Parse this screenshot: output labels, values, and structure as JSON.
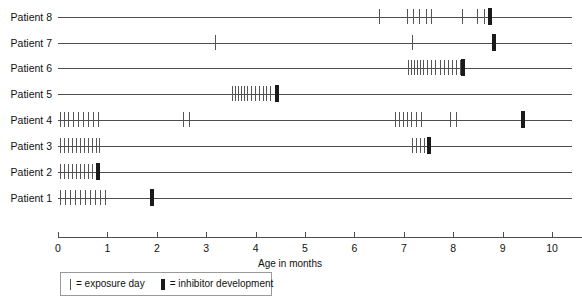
{
  "chart_data": {
    "type": "timeline",
    "title": "",
    "xlabel": "Age in months",
    "ylabel": "",
    "xlim": [
      0,
      10.6
    ],
    "xticks": [
      0,
      1,
      2,
      3,
      4,
      5,
      6,
      7,
      8,
      9,
      10
    ],
    "xtick_labels": [
      "0",
      "1",
      "2",
      "3",
      "4",
      "5",
      "6",
      "7",
      "8",
      "9",
      "10"
    ],
    "grid": false,
    "legend_position": "bottom-left",
    "colors": {
      "exposure": "#555555",
      "inhibitor": "#1a1a1a",
      "axis": "#4d4d4d"
    },
    "series": [
      {
        "name": "Patient 8",
        "line_start": 0.0,
        "line_end": 10.4,
        "exposure_days": [
          6.5,
          7.06,
          7.18,
          7.3,
          7.44,
          7.56,
          8.18,
          8.48,
          8.62
        ],
        "inhibitor_development": 8.74
      },
      {
        "name": "Patient 7",
        "line_start": 0.0,
        "line_end": 10.4,
        "exposure_days": [
          3.18,
          7.16
        ],
        "inhibitor_development": 8.82
      },
      {
        "name": "Patient 6",
        "line_start": 0.0,
        "line_end": 10.4,
        "exposure_days": [
          7.08,
          7.14,
          7.2,
          7.26,
          7.32,
          7.38,
          7.46,
          7.56,
          7.64,
          7.74,
          7.82,
          7.9,
          7.98,
          8.06,
          8.14
        ],
        "inhibitor_development": 8.2
      },
      {
        "name": "Patient 5",
        "line_start": 0.0,
        "line_end": 10.4,
        "exposure_days": [
          3.52,
          3.58,
          3.64,
          3.7,
          3.76,
          3.82,
          3.9,
          3.98,
          4.06,
          4.14,
          4.22,
          4.3
        ],
        "inhibitor_development": 4.44
      },
      {
        "name": "Patient 4",
        "line_start": 0.0,
        "line_end": 10.4,
        "exposure_days": [
          0.04,
          0.12,
          0.2,
          0.3,
          0.4,
          0.5,
          0.6,
          0.7,
          0.8,
          2.54,
          2.66,
          6.82,
          6.9,
          6.98,
          7.06,
          7.14,
          7.24,
          7.34,
          7.94,
          8.06
        ],
        "inhibitor_development": 9.42
      },
      {
        "name": "Patient 3",
        "line_start": 0.0,
        "line_end": 10.4,
        "exposure_days": [
          0.04,
          0.12,
          0.2,
          0.28,
          0.36,
          0.44,
          0.52,
          0.6,
          0.68,
          0.76,
          0.84,
          7.16,
          7.24,
          7.32,
          7.4,
          7.48
        ],
        "inhibitor_development": 7.52
      },
      {
        "name": "Patient 2",
        "line_start": 0.0,
        "line_end": 10.4,
        "exposure_days": [
          0.04,
          0.12,
          0.2,
          0.28,
          0.36,
          0.44,
          0.52,
          0.6,
          0.68
        ],
        "inhibitor_development": 0.8
      },
      {
        "name": "Patient 1",
        "line_start": 0.0,
        "line_end": 10.4,
        "exposure_days": [
          0.04,
          0.14,
          0.24,
          0.34,
          0.44,
          0.54,
          0.64,
          0.74,
          0.86,
          0.96
        ],
        "inhibitor_development": 1.9
      }
    ]
  },
  "legend": {
    "exposure_label": "= exposure day",
    "inhibitor_label": "= inhibitor development"
  }
}
